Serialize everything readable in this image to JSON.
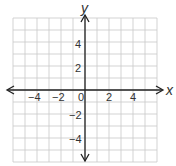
{
  "chart_data": {
    "type": "scatter",
    "title": "",
    "xlabel": "x",
    "ylabel": "y",
    "xlim": [
      -6,
      6
    ],
    "ylim": [
      -6,
      6
    ],
    "grid": true,
    "x_ticks": [
      "−4",
      "−2",
      "0",
      "2",
      "4"
    ],
    "y_ticks": [
      "4",
      "2",
      "−2",
      "−4"
    ],
    "series": []
  },
  "labels": {
    "x_axis": "x",
    "y_axis": "y",
    "origin": "0",
    "xt_m4": "−4",
    "xt_m2": "−2",
    "xt_2": "2",
    "xt_4": "4",
    "yt_4": "4",
    "yt_2": "2",
    "yt_m2": "−2",
    "yt_m4": "−4"
  }
}
